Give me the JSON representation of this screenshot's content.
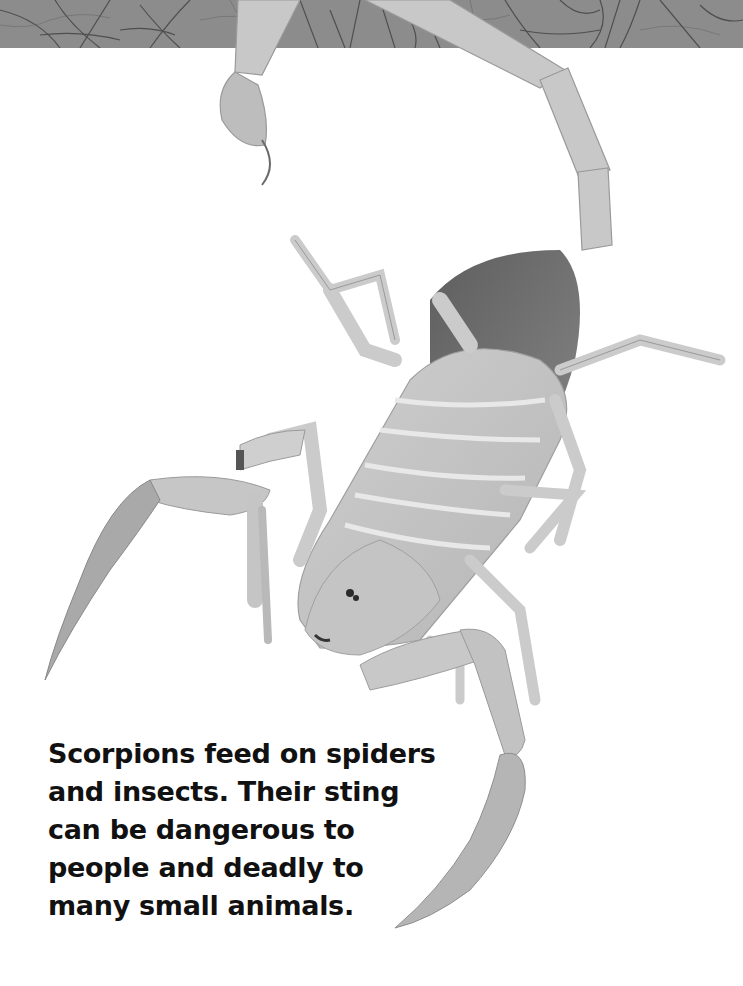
{
  "page": {
    "header_band": {
      "texture": "leaf-vein-pattern",
      "color": "#8a8a8a"
    },
    "photo": {
      "subject": "scorpion",
      "style": "grayscale"
    },
    "caption": {
      "lines": [
        "Scorpions feed on spiders",
        "and insects. Their sting",
        "can be dangerous to",
        "people and deadly to",
        "many small animals."
      ],
      "color": "#111111"
    }
  }
}
